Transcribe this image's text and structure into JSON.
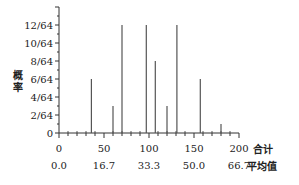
{
  "chart_data": {
    "type": "bar",
    "title": "",
    "xlabel": "合计",
    "x2label": "平均值",
    "ylabel": "概率",
    "x": [
      36,
      60,
      70,
      97,
      107,
      120,
      131,
      157,
      180
    ],
    "values": [
      6,
      3,
      12,
      12,
      8,
      3,
      12,
      6,
      1
    ],
    "value_unit": "/64",
    "xlim": [
      0,
      200
    ],
    "ylim": [
      0,
      14
    ],
    "x_ticks": [
      "0",
      "50",
      "100",
      "150",
      "200"
    ],
    "x2_ticks": [
      "0.0",
      "16.7",
      "33.3",
      "50.0",
      "66.7"
    ],
    "y_ticks": [
      "0",
      "2/64",
      "4/64",
      "6/64",
      "8/64",
      "10/64",
      "12/64"
    ],
    "grid": false,
    "legend": null,
    "bar_color": "#555555"
  }
}
